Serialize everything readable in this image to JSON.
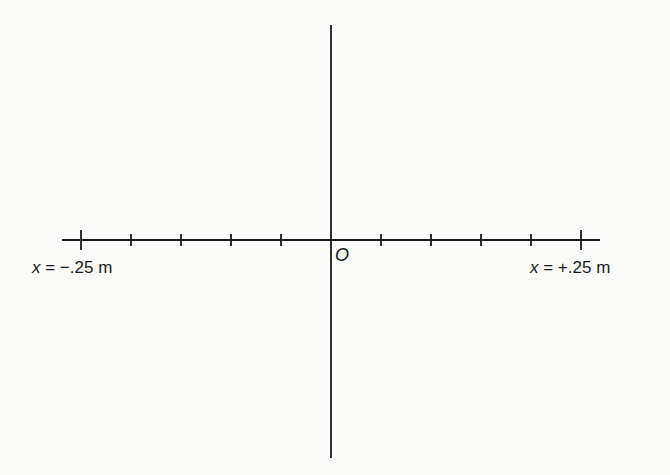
{
  "diagram": {
    "type": "coordinate-axes",
    "origin_label": "O",
    "left_label": {
      "var": "x",
      "text": " = −.25 m"
    },
    "right_label": {
      "var": "x",
      "text": " = +.25 m"
    },
    "colors": {
      "axis": "#1a1a1a",
      "background": "#fbfbfa"
    },
    "x_axis": {
      "y": 240,
      "x_start": 62,
      "x_end": 600
    },
    "y_axis": {
      "x": 331,
      "y_start": 25,
      "y_end": 458
    },
    "ticks": {
      "minor": [
        131,
        181,
        231,
        281,
        381,
        431,
        481,
        531
      ],
      "major": [
        81,
        581
      ],
      "minor_half_height": 6,
      "major_half_height": 10,
      "spacing_px": 50,
      "count_per_side": 5
    }
  }
}
